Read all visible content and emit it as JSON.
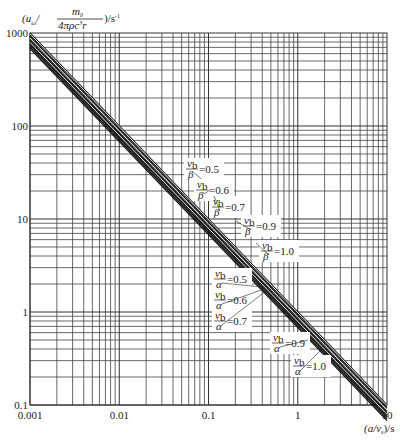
{
  "chart_data": {
    "type": "line",
    "scale": "log-log",
    "title": "",
    "ylabel": "(u_ω / (m_0 / 4πρc²r)) / s⁻¹",
    "ylabel_parts": {
      "open": "(u",
      "sub": "ω",
      "slash": "/",
      "num": "m",
      "num_sub": "0",
      "den": "4πρc",
      "den_sup": "3",
      "den_tail": "r",
      "close": ")/s",
      "close_sup": "-1"
    },
    "xlabel": "(a/v_s)/s",
    "xlabel_parts": {
      "open": "(a/v",
      "sub": "s",
      "close": ")/s"
    },
    "xlim": [
      0.001,
      10
    ],
    "ylim": [
      0.1,
      1000
    ],
    "x_ticks": [
      "0.001",
      "0.01",
      "0.1",
      "1",
      "10"
    ],
    "y_ticks": [
      "1000",
      "100",
      "10",
      "1",
      "0.1"
    ],
    "grid": true,
    "series": [
      {
        "name": "v_b/β=0.5",
        "x": [
          0.001,
          10
        ],
        "y": [
          1000,
          0.1
        ]
      },
      {
        "name": "v_b/β=0.6",
        "x": [
          0.001,
          10
        ],
        "y": [
          960,
          0.096
        ]
      },
      {
        "name": "v_b/β=0.7",
        "x": [
          0.001,
          10
        ],
        "y": [
          920,
          0.092
        ]
      },
      {
        "name": "v_b/β=0.9",
        "x": [
          0.001,
          10
        ],
        "y": [
          870,
          0.087
        ]
      },
      {
        "name": "v_b/β=1.0",
        "x": [
          0.001,
          10
        ],
        "y": [
          830,
          0.083
        ]
      },
      {
        "name": "v_b/α=0.5",
        "x": [
          0.001,
          10
        ],
        "y": [
          800,
          0.08
        ]
      },
      {
        "name": "v_b/α=0.6",
        "x": [
          0.001,
          10
        ],
        "y": [
          770,
          0.077
        ]
      },
      {
        "name": "v_b/α=0.7",
        "x": [
          0.001,
          10
        ],
        "y": [
          740,
          0.074
        ]
      },
      {
        "name": "v_b/α=0.9",
        "x": [
          0.001,
          10
        ],
        "y": [
          710,
          0.071
        ]
      },
      {
        "name": "v_b/α=1.0",
        "x": [
          0.001,
          10
        ],
        "y": [
          680,
          0.068
        ]
      }
    ],
    "annotations": [
      {
        "sym": "β",
        "val": "=0.5",
        "pos": [
          186,
          168
        ],
        "target": [
          208,
          184
        ]
      },
      {
        "sym": "β",
        "val": "=0.6",
        "pos": [
          196,
          189
        ],
        "target": [
          210,
          190
        ]
      },
      {
        "sym": "β",
        "val": "=0.7",
        "pos": [
          212,
          206
        ],
        "target": [
          214,
          196
        ]
      },
      {
        "sym": "β",
        "val": "=0.9",
        "pos": [
          243,
          225
        ],
        "target": [
          236,
          221
        ]
      },
      {
        "sym": "β",
        "val": "=1.0",
        "pos": [
          261,
          250
        ],
        "target": [
          256,
          243
        ]
      },
      {
        "sym": "α",
        "val": "=0.5",
        "pos": [
          214,
          278
        ],
        "target": [
          262,
          287
        ]
      },
      {
        "sym": "α",
        "val": "=0.6",
        "pos": [
          214,
          299
        ],
        "target": [
          264,
          289
        ]
      },
      {
        "sym": "α",
        "val": "=0.7",
        "pos": [
          214,
          320
        ],
        "target": [
          266,
          291
        ]
      },
      {
        "sym": "α",
        "val": "=0.9",
        "pos": [
          272,
          342
        ],
        "target": [
          308,
          340
        ]
      },
      {
        "sym": "α",
        "val": "=1.0",
        "pos": [
          293,
          365
        ],
        "target": [
          322,
          349
        ]
      }
    ]
  },
  "labels": {
    "sym_num": "v",
    "sym_num_sub": "b"
  }
}
